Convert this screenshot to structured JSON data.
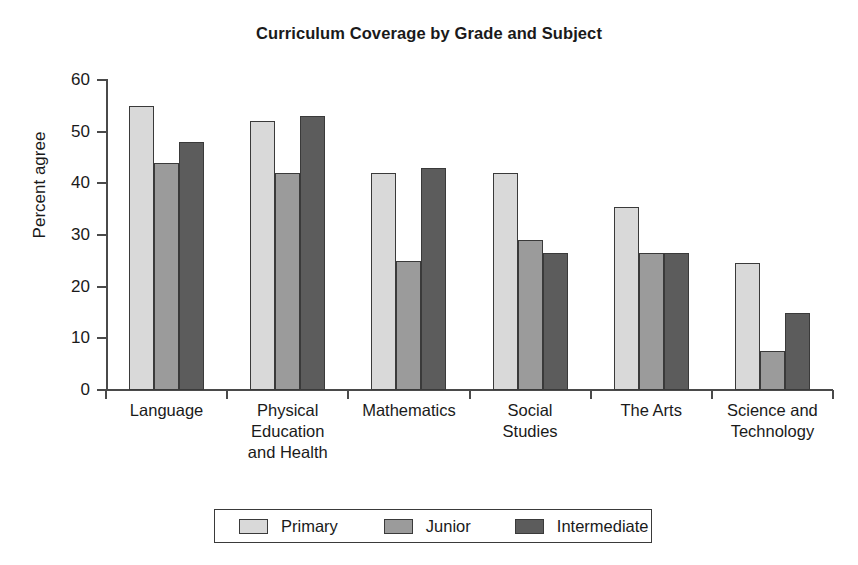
{
  "chart_data": {
    "type": "bar",
    "title": "Curriculum Coverage by Grade and Subject",
    "xlabel": "",
    "ylabel": "Percent agree",
    "ylim": [
      0,
      60
    ],
    "yticks": [
      0,
      10,
      20,
      30,
      40,
      50,
      60
    ],
    "grid": false,
    "legend_position": "bottom",
    "categories": [
      "Language",
      "Physical Education and Health",
      "Mathematics",
      "Social Studies",
      "The Arts",
      "Science and Technology"
    ],
    "category_label_lines": [
      [
        "Language"
      ],
      [
        "Physical",
        "Education",
        "and Health"
      ],
      [
        "Mathematics"
      ],
      [
        "Social",
        "Studies"
      ],
      [
        "The Arts"
      ],
      [
        "Science and",
        "Technology"
      ]
    ],
    "series": [
      {
        "name": "Primary",
        "color": "#d9d9d9",
        "values": [
          55,
          52,
          42,
          42,
          35.5,
          24.5
        ]
      },
      {
        "name": "Junior",
        "color": "#9b9b9b",
        "values": [
          44,
          42,
          25,
          29,
          26.5,
          7.5
        ]
      },
      {
        "name": "Intermediate",
        "color": "#5c5c5c",
        "values": [
          48,
          53,
          43,
          26.5,
          26.5,
          15
        ]
      }
    ]
  },
  "legend": {
    "items": [
      {
        "label": "Primary"
      },
      {
        "label": "Junior"
      },
      {
        "label": "Intermediate"
      }
    ]
  }
}
